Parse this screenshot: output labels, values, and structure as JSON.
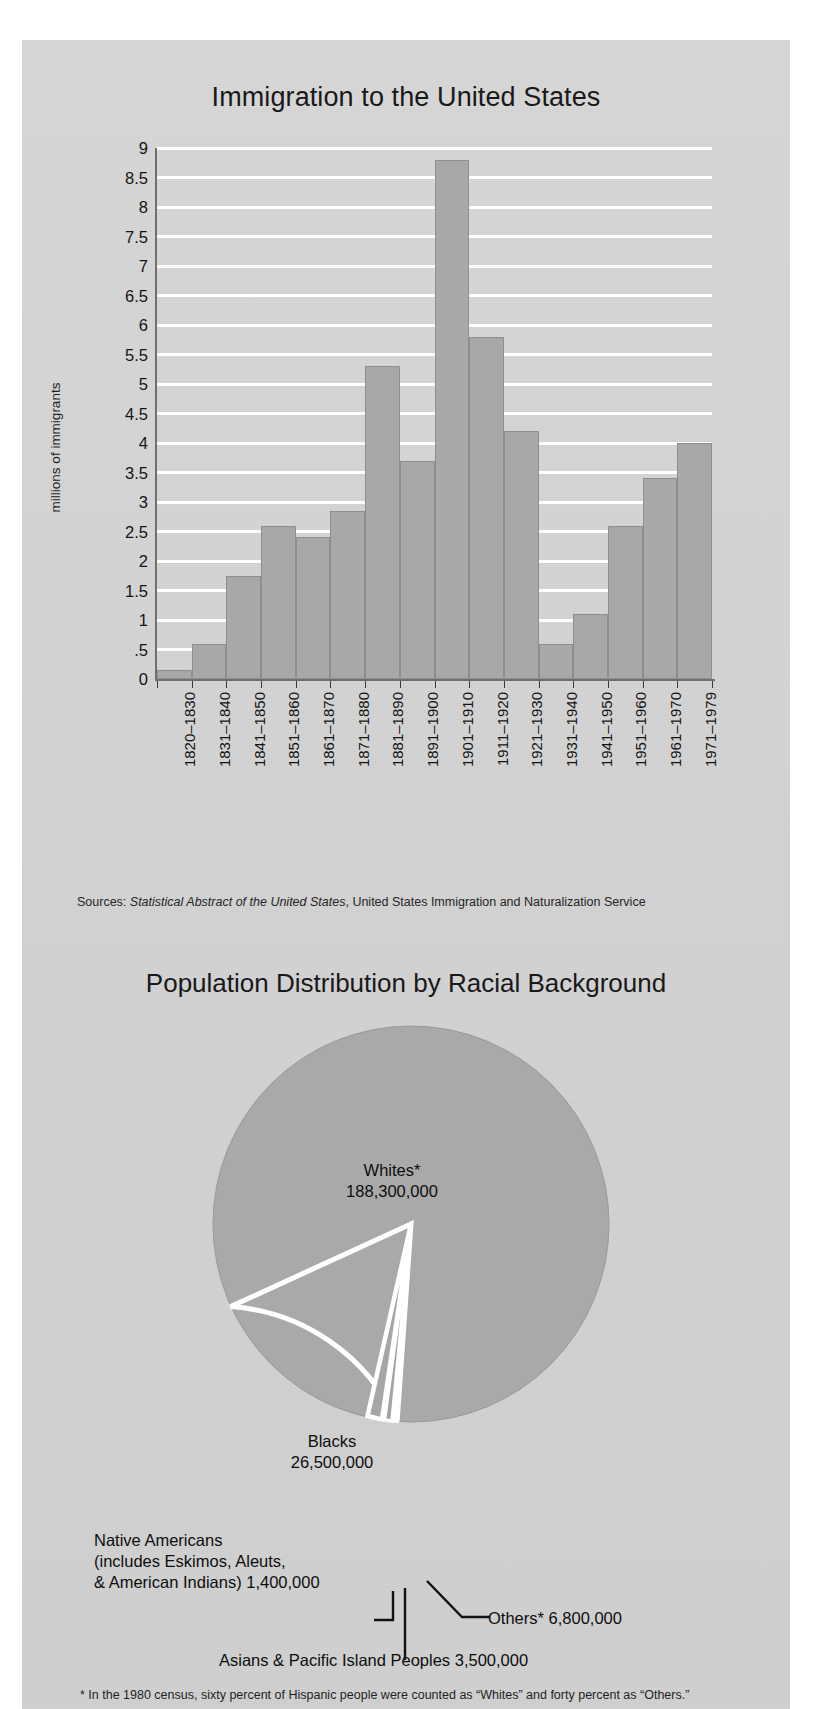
{
  "poster": {
    "background_color": "#d4d4d4",
    "bar_color": "#a8a8a8",
    "gridline_color": "#ffffff"
  },
  "bar_section": {
    "title": "Immigration to the United States",
    "ylabel": "millions of immigrants",
    "sources_prefix": "Sources: ",
    "sources_italic": "Statistical Abstract of the United States",
    "sources_suffix": ", United States Immigration and Naturalization Service"
  },
  "pie_section": {
    "title": "Population Distribution by Racial Background",
    "labels": {
      "whites_name": "Whites*",
      "whites_value": "188,300,000",
      "blacks_name": "Blacks",
      "blacks_value": "26,500,000",
      "native_line1": "Native Americans",
      "native_line2": "(includes Eskimos, Aleuts,",
      "native_line3": "& American Indians) 1,400,000",
      "asians": "Asians & Pacific Island Peoples 3,500,000",
      "others": "Others* 6,800,000"
    },
    "footnote1": "* In the 1980 census, sixty percent of Hispanic people were counted as “Whites” and forty percent as “Others.”",
    "footnote2": "Source: Bureau of the Census, 1980 Provisional Data"
  },
  "chart_data": [
    {
      "type": "bar",
      "title": "Immigration to the United States",
      "xlabel": "",
      "ylabel": "millions of immigrants",
      "ylim": [
        0,
        9
      ],
      "ytick_labels": [
        "9",
        "8.5",
        "8",
        "7.5",
        "7",
        "6.5",
        "6",
        "5.5",
        "5",
        "4.5",
        "4",
        "3.5",
        "3",
        "2.5",
        "2",
        "1.5",
        "1",
        ".5",
        "0"
      ],
      "ytick_values": [
        9,
        8.5,
        8,
        7.5,
        7,
        6.5,
        6,
        5.5,
        5,
        4.5,
        4,
        3.5,
        3,
        2.5,
        2,
        1.5,
        1,
        0.5,
        0
      ],
      "grid": true,
      "legend": "none",
      "categories": [
        "1820–1830",
        "1831–1840",
        "1841–1850",
        "1851–1860",
        "1861–1870",
        "1871–1880",
        "1881–1890",
        "1891–1900",
        "1901–1910",
        "1911–1920",
        "1921–1930",
        "1931–1940",
        "1941–1950",
        "1951–1960",
        "1961–1970",
        "1971–1979"
      ],
      "values": [
        0.15,
        0.6,
        1.75,
        2.6,
        2.4,
        2.85,
        5.3,
        3.7,
        8.8,
        5.8,
        4.2,
        0.6,
        1.1,
        2.6,
        3.4,
        4.0
      ],
      "units": "millions of immigrants",
      "sources": "Sources: Statistical Abstract of the United States, United States Immigration and Naturalization Service"
    },
    {
      "type": "pie",
      "title": "Population Distribution by Racial Background",
      "labels": [
        "Whites*",
        "Blacks",
        "Native Americans (includes Eskimos, Aleuts, & American Indians)",
        "Asians & Pacific Island Peoples",
        "Others*"
      ],
      "value_labels": [
        "188,300,000",
        "26,500,000",
        "1,400,000",
        "3,500,000",
        "6,800,000"
      ],
      "values": [
        188300000,
        26500000,
        1400000,
        3500000,
        6800000
      ],
      "legend": "callout-labels",
      "footnote": "* In the 1980 census, sixty percent of Hispanic people were counted as “Whites” and forty percent as “Others.”",
      "source": "Source: Bureau of the Census, 1980 Provisional Data"
    }
  ]
}
